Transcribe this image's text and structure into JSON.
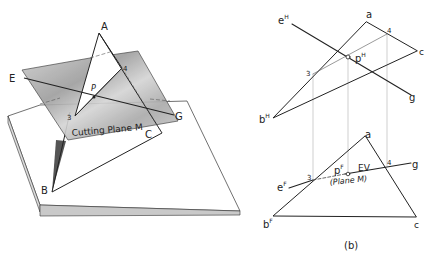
{
  "pictorial": {
    "points": {
      "A": "A",
      "B": "B",
      "C": "C",
      "E": "E",
      "G": "G",
      "P": "P",
      "three": "3",
      "four": "4"
    },
    "plane_label": "Cutting Plane M"
  },
  "orthographic": {
    "top_view": {
      "a": "a",
      "bH": "b",
      "bH_sup": "H",
      "c": "c",
      "eH": "e",
      "eH_sup": "H",
      "g": "g",
      "pH": "p",
      "pH_sup": "H",
      "three": "3",
      "four": "4"
    },
    "front_view": {
      "a": "a",
      "bF": "b",
      "bF_sup": "F",
      "c": "c",
      "eF": "e",
      "eF_sup": "F",
      "g": "g",
      "pF": "p",
      "pF_sup": "F",
      "three": "3",
      "four": "4",
      "ev": "EV",
      "plane": "(Plane M)"
    },
    "caption": "(b)"
  },
  "colors": {
    "line": "#222222",
    "plane_fill": "#bdbdbd",
    "projector": "#b0b0b0"
  }
}
